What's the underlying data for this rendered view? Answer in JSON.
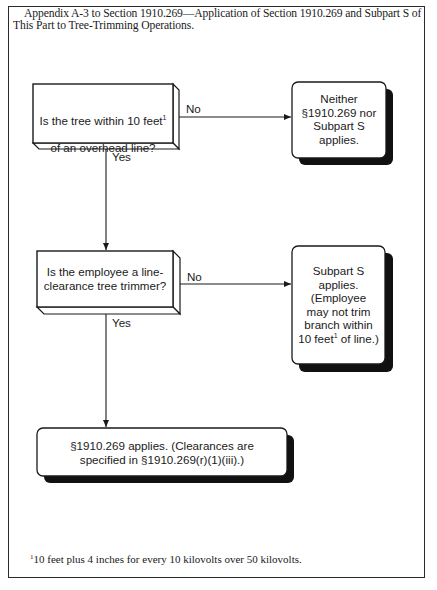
{
  "title": "Appendix A-3 to Section 1910.269—Application of Section 1910.269 and Subpart S of This Part to Tree-Trimming Operations.",
  "nodes": {
    "q1": {
      "type": "decision",
      "line1": "Is the tree within 10 feet",
      "sup": "1",
      "line2": "of an overhead line?"
    },
    "r1": {
      "type": "outcome",
      "text": "Neither\n§1910.269 nor\nSubpart S\napplies."
    },
    "q2": {
      "type": "decision",
      "text": "Is the employee a line-\nclearance tree trimmer?"
    },
    "r2": {
      "type": "outcome",
      "text_before": "Subpart S\napplies.\n(Employee\nmay not trim\nbranch within\n10 feet",
      "sup": "1",
      "text_after": " of line.)"
    },
    "r3": {
      "type": "outcome",
      "text": "§1910.269 applies. (Clearances are\nspecified in §1910.269(r)(1)(iii).)"
    }
  },
  "edges": {
    "q1_no": {
      "from": "q1",
      "to": "r1",
      "label": "No"
    },
    "q1_yes": {
      "from": "q1",
      "to": "q2",
      "label": "Yes"
    },
    "q2_no": {
      "from": "q2",
      "to": "r2",
      "label": "No"
    },
    "q2_yes": {
      "from": "q2",
      "to": "r3",
      "label": "Yes"
    }
  },
  "footnote": {
    "marker": "1",
    "text": "10 feet plus 4 inches for every 10 kilovolts over 50 kilovolts."
  },
  "colors": {
    "line": "#1a1a1a",
    "shadow": "#111111",
    "box_fill": "#ffffff"
  }
}
